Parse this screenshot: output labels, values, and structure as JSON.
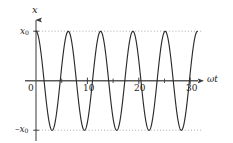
{
  "figure": {
    "background": "#ffffff",
    "ink_color": "#2b2b2b",
    "axis_color": "#4a4a4a",
    "dotted_color": "#7b7b7b"
  },
  "labels": {
    "y_axis": "x",
    "x_axis": "ωt",
    "amplitude_pos": "x",
    "amplitude_pos_sub": "0",
    "amplitude_neg": "–x",
    "amplitude_neg_sub": "0",
    "origin": "0"
  },
  "chart_data": {
    "type": "line",
    "title": "",
    "xlabel": "ωt",
    "ylabel": "x",
    "grid": false,
    "legend": null,
    "xlim": [
      -0.6,
      33.0
    ],
    "ylim": [
      -1.35,
      1.35
    ],
    "x_ticks": [
      0,
      10,
      20,
      30
    ],
    "x_tick_labels": [
      "0",
      "10",
      "20",
      "30"
    ],
    "x_minor_ticks": [
      5,
      15,
      25
    ],
    "y_ticks": [
      -1,
      1
    ],
    "y_tick_labels": [
      "–x₀",
      "x₀"
    ],
    "reference_lines": [
      {
        "y": 1,
        "style": "dotted",
        "label": "x₀"
      },
      {
        "y": -1,
        "style": "dotted",
        "label": "–x₀"
      }
    ],
    "series": [
      {
        "name": "x(ωt)",
        "equation": "x = x0 * cos(ωt)",
        "amplitude": 1,
        "period": 6.2832,
        "phase": 0,
        "n_visible_cycles": 5,
        "x_start": 0,
        "x_end": 31.4,
        "color": "#2b2b2b"
      }
    ],
    "peaks_x": [
      0.0,
      6.28,
      12.57,
      18.85,
      25.13,
      31.42
    ],
    "troughs_x": [
      3.14,
      9.42,
      15.71,
      21.99,
      28.27
    ]
  }
}
